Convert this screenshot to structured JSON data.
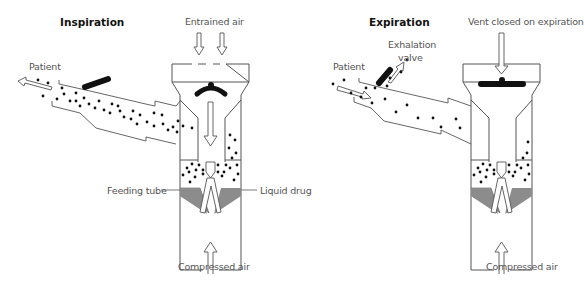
{
  "diagrams": [
    {
      "id": "inspiration",
      "title": "Inspiration",
      "labels": {
        "top_air": "Entrained air",
        "patient": "Patient",
        "feeding_tube": "Feeding tube",
        "liquid_drug": "Liquid drug",
        "bottom_air": "Compressed air"
      },
      "flow_direction": "toward patient",
      "vent_state": "open"
    },
    {
      "id": "expiration",
      "title": "Expiration",
      "labels": {
        "top_air": "Vent closed on expiration",
        "patient": "Patient",
        "exhalation_valve_line1": "Exhalation",
        "exhalation_valve_line2": "valve",
        "bottom_air": "Compressed air"
      },
      "flow_direction": "from patient out through exhalation valve",
      "vent_state": "closed"
    }
  ],
  "colors": {
    "line": "#555555",
    "liquid": "#8c8c8c",
    "particle": "#111111",
    "valve": "#111111",
    "label": "#555555",
    "title": "#111111"
  }
}
